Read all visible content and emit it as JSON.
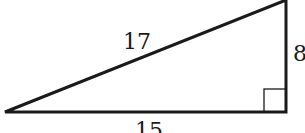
{
  "diagram": {
    "type": "right-triangle",
    "stroke_color": "#1a1a1a",
    "vertices": {
      "bottom_left": [
        5,
        112
      ],
      "bottom_right": [
        286,
        112
      ],
      "top_right": [
        286,
        0
      ]
    },
    "right_angle_marker": {
      "vertex": "bottom_right",
      "size": 22
    },
    "labels": {
      "hypotenuse": "17",
      "vertical_leg": "8",
      "horizontal_leg": "15"
    }
  }
}
